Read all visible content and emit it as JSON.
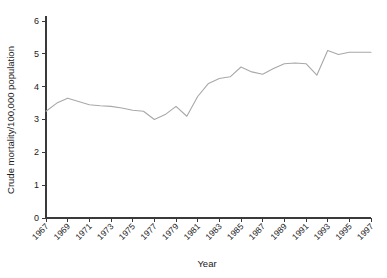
{
  "chart_data": {
    "type": "line",
    "title": "",
    "subtitle": "",
    "xlabel": "Year",
    "ylabel": "Crude mortality/100,000 population",
    "x": [
      1967,
      1968,
      1969,
      1970,
      1971,
      1972,
      1973,
      1974,
      1975,
      1976,
      1977,
      1978,
      1979,
      1980,
      1981,
      1982,
      1983,
      1984,
      1985,
      1986,
      1987,
      1988,
      1989,
      1990,
      1991,
      1992,
      1993,
      1994,
      1995,
      1996,
      1997
    ],
    "values": [
      3.25,
      3.5,
      3.65,
      3.55,
      3.45,
      3.42,
      3.4,
      3.35,
      3.28,
      3.25,
      3.0,
      3.15,
      3.4,
      3.1,
      3.7,
      4.1,
      4.25,
      4.3,
      4.6,
      4.45,
      4.38,
      4.55,
      4.7,
      4.72,
      4.7,
      4.35,
      5.1,
      4.98,
      5.05,
      5.05,
      5.05
    ],
    "series": [
      {
        "name": "Crude mortality",
        "color": "#a8a8a8",
        "values": [
          3.25,
          3.5,
          3.65,
          3.55,
          3.45,
          3.42,
          3.4,
          3.35,
          3.28,
          3.25,
          3.0,
          3.15,
          3.4,
          3.1,
          3.7,
          4.1,
          4.25,
          4.3,
          4.6,
          4.45,
          4.38,
          4.55,
          4.7,
          4.72,
          4.7,
          4.35,
          5.1,
          4.98,
          5.05,
          5.05,
          5.05
        ]
      }
    ],
    "xlim": [
      1967,
      1997
    ],
    "ylim": [
      0,
      6
    ],
    "yticks": [
      0,
      1,
      2,
      3,
      4,
      5,
      6
    ],
    "ytick_labels": [
      "0",
      "1",
      "2",
      "3",
      "4",
      "5",
      "6"
    ],
    "xticks": [
      1967,
      1969,
      1971,
      1973,
      1975,
      1977,
      1979,
      1981,
      1983,
      1985,
      1987,
      1989,
      1991,
      1993,
      1995,
      1997
    ],
    "xtick_labels": [
      "1967",
      "1969",
      "1971",
      "1973",
      "1975",
      "1977",
      "1979",
      "1981",
      "1983",
      "1985",
      "1987",
      "1989",
      "1991",
      "1993",
      "1995",
      "1997"
    ],
    "xtick_rotation": 45,
    "grid": false,
    "legend": false,
    "legend_position": "none"
  }
}
